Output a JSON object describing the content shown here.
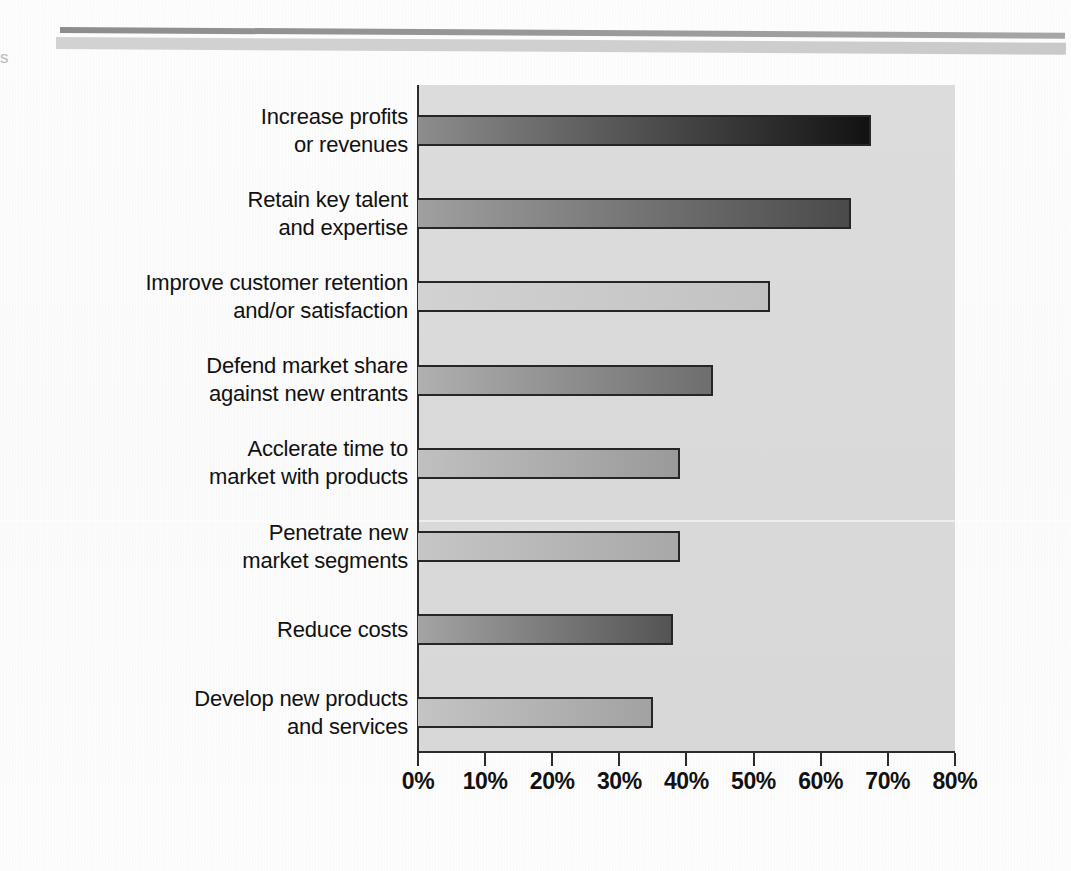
{
  "page": {
    "edge_glyph": "s"
  },
  "chart_data": {
    "type": "bar",
    "orientation": "horizontal",
    "title": "",
    "subtitle": "",
    "xlabel": "",
    "ylabel": "",
    "xlim": [
      0,
      80
    ],
    "grid": false,
    "legend": null,
    "xtick_labels": [
      "0%",
      "10%",
      "20%",
      "30%",
      "40%",
      "50%",
      "60%",
      "70%",
      "80%"
    ],
    "xticks": [
      0,
      10,
      20,
      30,
      40,
      50,
      60,
      70,
      80
    ],
    "categories": [
      "Increase profits\nor revenues",
      "Retain key talent\nand expertise",
      "Improve customer retention\nand/or satisfaction",
      "Defend market share\nagainst new entrants",
      "Acclerate time to\nmarket with products",
      "Penetrate new\nmarket segments",
      "Reduce costs",
      "Develop new products\nand services"
    ],
    "category_lines": [
      [
        "Increase profits",
        "or revenues"
      ],
      [
        "Retain key talent",
        "and expertise"
      ],
      [
        "Improve customer retention",
        "and/or satisfaction"
      ],
      [
        "Defend market share",
        "against new entrants"
      ],
      [
        "Acclerate time to",
        "market with products"
      ],
      [
        "Penetrate new",
        "market segments"
      ],
      [
        "Reduce costs"
      ],
      [
        "Develop new products",
        "and services"
      ]
    ],
    "values": [
      67.5,
      64.5,
      52.5,
      44,
      39,
      39,
      38,
      35
    ],
    "bar_fills": [
      {
        "from": "#8d8d8d",
        "to": "#121212"
      },
      {
        "from": "#a0a0a0",
        "to": "#4a4a4a"
      },
      {
        "from": "#d2d2d2",
        "to": "#c2c2c2"
      },
      {
        "from": "#b0b0b0",
        "to": "#6e6e6e"
      },
      {
        "from": "#c0c0c0",
        "to": "#9a9a9a"
      },
      {
        "from": "#c6c6c6",
        "to": "#a8a8a8"
      },
      {
        "from": "#a4a4a4",
        "to": "#545454"
      },
      {
        "from": "#c4c4c4",
        "to": "#a2a2a2"
      }
    ]
  },
  "colors": {
    "plot_background": "#dadada",
    "axis": "#2b2b2b",
    "text": "#111111",
    "rule_dark": "#9a9a9a",
    "rule_light": "#cfcfcf",
    "page_background": "#fdfdfd"
  }
}
